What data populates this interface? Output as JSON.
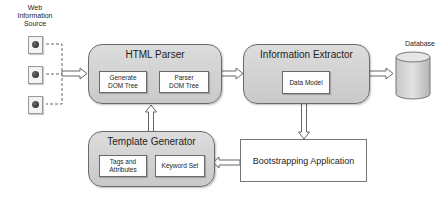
{
  "source": {
    "label_lines": [
      "Web",
      "Information",
      "Source"
    ],
    "documents": [
      {
        "icon": "web-document-icon"
      },
      {
        "icon": "web-document-icon"
      },
      {
        "icon": "web-document-icon"
      }
    ]
  },
  "html_parser": {
    "title": "HTML Parser",
    "children": [
      {
        "label_lines": [
          "Generate",
          "DOM Tree"
        ]
      },
      {
        "label_lines": [
          "Parser",
          "DOM Tree"
        ]
      }
    ]
  },
  "information_extractor": {
    "title": "Information Extractor",
    "children": [
      {
        "label": "Data Model"
      }
    ]
  },
  "database": {
    "label": "Database",
    "icon": "database-cylinder-icon"
  },
  "template_generator": {
    "title": "Template Generator",
    "children": [
      {
        "label_lines": [
          "Tags and",
          "Attributes"
        ]
      },
      {
        "label": "Keyword Set"
      }
    ]
  },
  "bootstrapping_application": {
    "label": "Bootstrapping Application"
  },
  "colors": {
    "box_fill": "#d2d2d2",
    "border": "#6a6a6a",
    "inner_fill": "#fdfdfd"
  }
}
